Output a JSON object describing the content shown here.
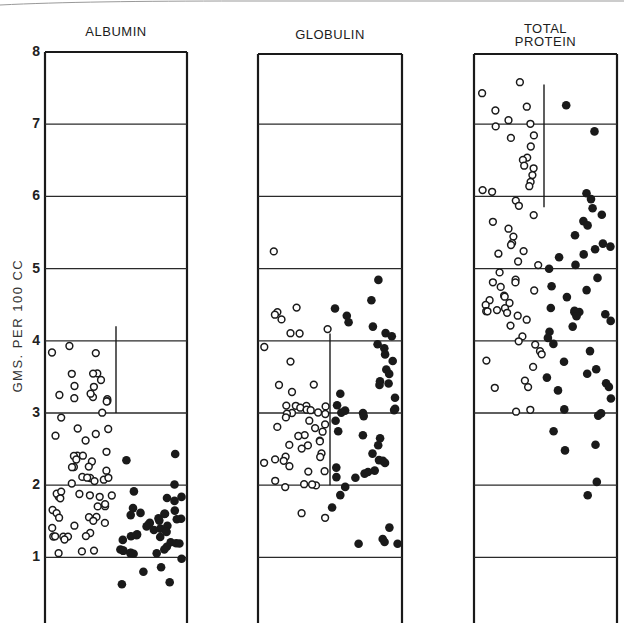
{
  "chart_data": {
    "type": "scatter",
    "title": "",
    "ylabel": "GMS. PER 100 CC",
    "xlabel": "",
    "ylim": [
      0,
      8
    ],
    "yticks": [
      1,
      2,
      3,
      4,
      5,
      6,
      7,
      8
    ],
    "grid": true,
    "legend": null,
    "marker_legend": {
      "open_circle": "group 1 (left column of each panel)",
      "filled_circle": "group 2 (right column of each panel)"
    },
    "panels": [
      {
        "title": "ALBUMIN",
        "range_marker": {
          "from": 3.0,
          "to": 4.2
        },
        "series": [
          {
            "name": "open",
            "marker": "open",
            "values": [
              3.85,
              3.92,
              3.83,
              3.55,
              3.55,
              3.55,
              3.45,
              3.38,
              3.35,
              3.22,
              3.2,
              3.25,
              3.17,
              3.27,
              3.17,
              3.2,
              3.0,
              2.93,
              2.78,
              2.78,
              2.72,
              2.68,
              2.62,
              2.4,
              2.45,
              2.4,
              2.34,
              2.4,
              2.35,
              2.25,
              2.25,
              2.25,
              2.2,
              2.08,
              2.1,
              2.12,
              2.1,
              2.05,
              2.1,
              2.02,
              1.85,
              1.85,
              1.88,
              1.9,
              1.85,
              1.85,
              1.88,
              1.83,
              1.72,
              1.75,
              1.7,
              1.65,
              1.6,
              1.55,
              1.56,
              1.5,
              1.47,
              1.45,
              1.55,
              1.42,
              1.35,
              1.3,
              1.3,
              1.3,
              1.28,
              1.25,
              1.3,
              1.1,
              1.07,
              1.07
            ]
          },
          {
            "name": "filled",
            "marker": "filled",
            "values": [
              2.35,
              2.42,
              2.02,
              1.85,
              1.82,
              1.92,
              1.78,
              1.68,
              1.65,
              1.62,
              1.6,
              1.6,
              1.58,
              1.55,
              1.55,
              1.52,
              1.5,
              1.48,
              1.45,
              1.45,
              1.42,
              1.4,
              1.38,
              1.35,
              1.35,
              1.32,
              1.3,
              1.3,
              1.28,
              1.25,
              1.22,
              1.2,
              1.18,
              1.15,
              1.12,
              1.1,
              1.08,
              1.08,
              1.07,
              1.05,
              1.07,
              1.05,
              0.98,
              0.87,
              0.8,
              0.62,
              0.67
            ]
          }
        ]
      },
      {
        "title": "GLOBULIN",
        "range_marker": {
          "from": 2.0,
          "to": 4.1
        },
        "series": [
          {
            "name": "open",
            "marker": "open",
            "values": [
              5.25,
              4.45,
              4.4,
              4.35,
              4.3,
              4.1,
              4.15,
              4.1,
              3.9,
              3.7,
              3.4,
              3.4,
              3.3,
              3.1,
              3.1,
              3.1,
              3.1,
              3.08,
              3.05,
              3.05,
              3.02,
              3.0,
              3.0,
              2.98,
              2.95,
              2.9,
              2.85,
              2.8,
              2.78,
              2.75,
              2.7,
              2.68,
              2.62,
              2.6,
              2.55,
              2.55,
              2.5,
              2.45,
              2.4,
              2.38,
              2.35,
              2.3,
              2.25,
              2.2,
              2.35,
              2.2,
              2.05,
              2.0,
              2.0,
              2.0,
              1.98,
              1.55,
              1.62
            ]
          },
          {
            "name": "filled",
            "marker": "filled",
            "values": [
              4.85,
              4.55,
              4.45,
              4.35,
              4.25,
              4.2,
              4.1,
              4.05,
              3.95,
              3.9,
              3.8,
              3.72,
              3.6,
              3.55,
              3.45,
              3.4,
              3.38,
              3.28,
              3.2,
              3.1,
              3.05,
              3.05,
              3.02,
              3.0,
              3.0,
              2.95,
              2.88,
              2.75,
              2.7,
              2.65,
              2.55,
              2.45,
              2.35,
              2.35,
              2.3,
              2.25,
              2.2,
              2.18,
              2.15,
              2.1,
              2.1,
              1.98,
              1.85,
              1.7,
              1.4,
              1.25,
              1.2,
              1.2,
              1.18
            ]
          }
        ]
      },
      {
        "title": "TOTAL PROTEIN",
        "range_marker": {
          "from": 5.85,
          "to": 7.55
        },
        "series": [
          {
            "name": "open",
            "marker": "open",
            "values": [
              7.58,
              7.42,
              7.25,
              7.2,
              7.0,
              7.05,
              6.98,
              6.85,
              6.82,
              6.7,
              6.55,
              6.5,
              6.42,
              6.38,
              6.3,
              6.2,
              6.15,
              6.08,
              6.05,
              5.95,
              5.88,
              5.75,
              5.65,
              5.55,
              5.45,
              5.35,
              5.32,
              5.25,
              5.2,
              5.1,
              5.05,
              4.95,
              4.85,
              4.8,
              4.8,
              4.75,
              4.7,
              4.62,
              4.6,
              4.55,
              4.52,
              4.5,
              4.45,
              4.42,
              4.42,
              4.4,
              4.38,
              4.35,
              4.3,
              4.22,
              4.05,
              4.0,
              3.95,
              3.85,
              3.8,
              3.72,
              3.65,
              3.45,
              3.35,
              3.35,
              3.05,
              3.03
            ]
          },
          {
            "name": "filled",
            "marker": "filled",
            "values": [
              7.25,
              6.9,
              6.05,
              5.95,
              5.85,
              5.75,
              5.65,
              5.6,
              5.45,
              5.35,
              5.3,
              5.28,
              5.2,
              5.15,
              5.05,
              5.0,
              4.88,
              4.75,
              4.7,
              4.6,
              4.45,
              4.42,
              4.4,
              4.4,
              4.38,
              4.35,
              4.28,
              4.2,
              4.12,
              4.05,
              3.95,
              3.85,
              3.7,
              3.6,
              3.55,
              3.5,
              3.42,
              3.35,
              3.3,
              3.2,
              3.05,
              3.0,
              2.95,
              2.75,
              2.55,
              2.48,
              2.05,
              1.85
            ]
          }
        ]
      }
    ]
  },
  "panels": {
    "albumin": {
      "title": "ALBUMIN"
    },
    "globulin": {
      "title": "GLOBULIN"
    },
    "total_protein": {
      "title_line1": "TOTAL",
      "title_line2": "PROTEIN"
    }
  },
  "axis": {
    "ylabel": "GMS. PER 100 CC",
    "ticks": [
      "8",
      "7",
      "6",
      "5",
      "4",
      "3",
      "2",
      "1"
    ]
  },
  "colors": {
    "ink": "#1a1a1a",
    "grid": "#2a2a2a",
    "background": "#ffffff"
  }
}
